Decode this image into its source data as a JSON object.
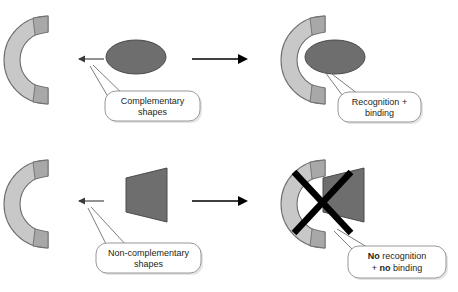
{
  "figure": {
    "background_color": "#ffffff"
  },
  "colors": {
    "receptor_fill": "#c8c8c8",
    "receptor_edge": "#a8a8a8",
    "receptor_stroke": "#6f6f6f",
    "ligand_fill": "#6e6e6e",
    "ligand_stroke": "#4a4a4a",
    "arrow": "#000000",
    "x_mark": "#000000",
    "callout_fill": "#ffffff",
    "callout_stroke": "#8d8d8d",
    "text": "#231f20"
  },
  "rows": [
    {
      "id": "complementary-row",
      "left_panel": {
        "receptor_name": "c-shaped-receptor",
        "ligand_name": "ellipse-ligand",
        "ligand_shape": "ellipse",
        "binding_arrow": "left-arrow"
      },
      "right_panel": {
        "receptor_name": "c-shaped-receptor",
        "ligand_name": "ellipse-ligand",
        "ligand_shape": "ellipse",
        "bound": true,
        "x_mark": false
      },
      "left_callout": {
        "line1": "Complementary",
        "line2": "shapes"
      },
      "right_callout": {
        "line1": "Recognition +",
        "line2": "binding"
      }
    },
    {
      "id": "non-complementary-row",
      "left_panel": {
        "receptor_name": "c-shaped-receptor",
        "ligand_name": "wedge-ligand",
        "ligand_shape": "trapezoid",
        "binding_arrow": "left-arrow"
      },
      "right_panel": {
        "receptor_name": "c-shaped-receptor",
        "ligand_name": "wedge-ligand",
        "ligand_shape": "trapezoid",
        "bound": false,
        "x_mark": true
      },
      "left_callout": {
        "line1": "Non-complementary",
        "line2": "shapes"
      },
      "right_callout": {
        "line1_bold": "No",
        "line1_rest": " recognition",
        "line2_prefix": "+ ",
        "line2_bold": "no",
        "line2_rest": " binding"
      }
    }
  ]
}
